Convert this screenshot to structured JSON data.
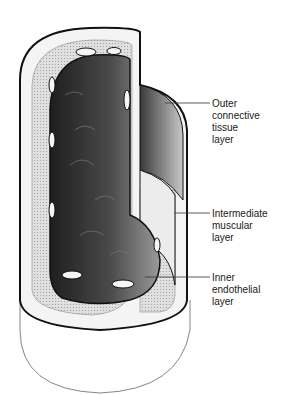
{
  "diagram": {
    "labels": [
      {
        "id": "outer",
        "text": "Outer\nconnective\ntissue\nlayer"
      },
      {
        "id": "intermediate",
        "text": "Intermediate\nmuscular\nlayer"
      },
      {
        "id": "inner",
        "text": "Inner\nendothelial\nlayer"
      }
    ],
    "colors": {
      "outline": "#111111",
      "lumen_dark": "#2a2a2a",
      "lumen_light": "#bdbdbd",
      "outer_layer": "#f2f2f2",
      "muscular_layer": "#cfcfcf",
      "background": "#ffffff"
    }
  }
}
